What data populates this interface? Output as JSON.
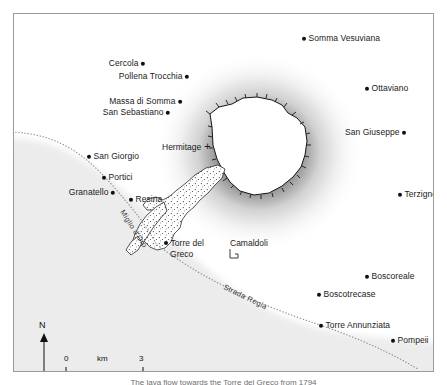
{
  "figure": {
    "type": "map",
    "region": "Mount Vesuvius and the Bay of Naples",
    "caption": "The lava flow towards the Torre del Greco from 1794"
  },
  "map": {
    "background_color": "#ffffff",
    "sea_color": "#ececec",
    "frame_color": "#9a9a9a",
    "volcano_summit_color": "#ffffff",
    "volcano_shading_color": "#101010",
    "lava_flow_color": "#ffffff",
    "road_color": "#8a8a8a"
  },
  "places": [
    {
      "name": "Somma Vesuviana",
      "x": 288,
      "y": 24,
      "align": "left"
    },
    {
      "name": "Cercola",
      "x": 131,
      "y": 49,
      "align": "right"
    },
    {
      "name": "Pollena Trocchia",
      "x": 175,
      "y": 62,
      "align": "right"
    },
    {
      "name": "Ottaviano",
      "x": 351,
      "y": 74,
      "align": "left"
    },
    {
      "name": "Massa di Somma",
      "x": 168,
      "y": 87,
      "align": "right"
    },
    {
      "name": "San Sebastiano",
      "x": 156,
      "y": 98,
      "align": "right"
    },
    {
      "name": "San Giuseppe",
      "x": 392,
      "y": 118,
      "align": "right"
    },
    {
      "name": "San Giorgio",
      "x": 73,
      "y": 142,
      "align": "left"
    },
    {
      "name": "Portici",
      "x": 88,
      "y": 163,
      "align": "left"
    },
    {
      "name": "Granatello",
      "x": 101,
      "y": 178,
      "align": "right"
    },
    {
      "name": "Terzigno",
      "x": 384,
      "y": 180,
      "align": "left"
    },
    {
      "name": "Resina",
      "x": 115,
      "y": 185,
      "align": "left"
    },
    {
      "name": "Boscoreale",
      "x": 351,
      "y": 262,
      "align": "left"
    },
    {
      "name": "Boscotrecase",
      "x": 303,
      "y": 280,
      "align": "left"
    },
    {
      "name": "Torre Annunziata",
      "x": 305,
      "y": 311,
      "align": "left"
    },
    {
      "name": "Pompeii",
      "x": 377,
      "y": 326,
      "align": "left"
    }
  ],
  "place_multiline": {
    "name_line1": "Torre del",
    "name_line2": "Greco",
    "x": 150,
    "y": 234
  },
  "symbols": {
    "hermitage": {
      "label": "Hermitage",
      "glyph": "+",
      "x": 148,
      "y": 131
    },
    "camaldoli": {
      "label": "Camaldoli",
      "glyph": "monastery-glyph",
      "x": 216,
      "y": 229
    }
  },
  "roads": [
    {
      "name": "Miglio d'Oro",
      "x": 114,
      "y": 196,
      "rotation": 57
    },
    {
      "name": "Strada Regia",
      "x": 216,
      "y": 272,
      "rotation": 26
    }
  ],
  "scale_bar": {
    "min_label": "0",
    "unit_label": "km",
    "max_label": "3",
    "length_km": 3
  },
  "north_arrow": {
    "label": "N"
  }
}
